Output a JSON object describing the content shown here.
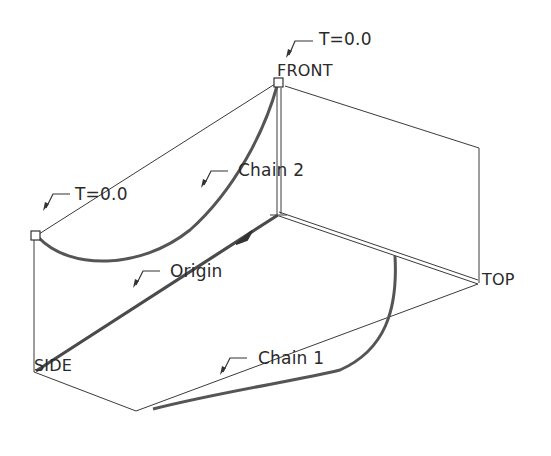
{
  "diagram": {
    "planes": {
      "front": "FRONT",
      "top": "TOP",
      "side": "SIDE"
    },
    "labels": {
      "t_front": "T=0.0",
      "t_left": "T=0.0",
      "chain2": "Chain 2",
      "origin": "Origin",
      "chain1": "Chain 1"
    },
    "colors": {
      "line": "#3a3a3a",
      "curve": "#555555",
      "background": "#ffffff"
    }
  }
}
